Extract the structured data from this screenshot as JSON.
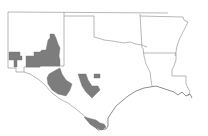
{
  "map": {
    "type": "choropleth",
    "area": "Texas and surrounding states (South Central US)",
    "states_shown": [
      "New Mexico",
      "Oklahoma",
      "Texas",
      "Arkansas",
      "Louisiana"
    ],
    "colors": {
      "background": "#ffffff",
      "border": "#9a9a9a",
      "highlighted_region": "#7d7d7d"
    },
    "highlighted_regions": [
      {
        "name": "southern-new-mexico-west",
        "state": "New Mexico"
      },
      {
        "name": "southern-new-mexico-east",
        "state": "New Mexico"
      },
      {
        "name": "trans-pecos-texas",
        "state": "Texas"
      },
      {
        "name": "big-bend-texas",
        "state": "Texas"
      },
      {
        "name": "south-central-texas",
        "state": "Texas"
      },
      {
        "name": "small-central-texas",
        "state": "Texas"
      },
      {
        "name": "lower-rio-grande-valley",
        "state": "Texas"
      }
    ]
  }
}
